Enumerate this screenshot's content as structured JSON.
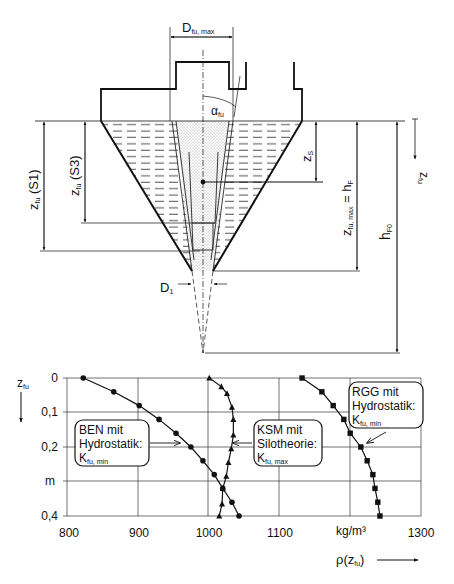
{
  "diagram": {
    "labels": {
      "d_fu_max": "D",
      "d_fu_max_sub": "fu, max",
      "alpha_fu": "α",
      "alpha_fu_sub": "fu",
      "z_s": "z",
      "z_s_sub": "S",
      "z_fu_max_hf": "z",
      "z_fu_max_hf_sub": "fu, max",
      "z_fu_max_hf_eq": " = h",
      "z_fu_max_hf_eq_sub": "F",
      "h_f0": "h",
      "h_f0_sub": "F0",
      "z_fu_axis": "z",
      "z_fu_axis_sub": "fu",
      "z_fu_s1": "z",
      "z_fu_s1_sub": "fu",
      "z_fu_s1_tail": " (S1)",
      "z_fu_s3": "z",
      "z_fu_s3_sub": "fu",
      "z_fu_s3_tail": " (S3)",
      "d1": "D",
      "d1_sub": "1"
    }
  },
  "chart": {
    "y_axis_label": "z",
    "y_axis_label_sub": "fu",
    "y_ticks": [
      "0",
      "0,1",
      "0,2",
      "m",
      "0,4"
    ],
    "x_ticks": [
      "800",
      "900",
      "1000",
      "1100",
      "kg/m³",
      "1300"
    ],
    "x_axis_label": "ρ(z",
    "x_axis_label_sub": "fu",
    "x_axis_label_tail": ")",
    "annotations": {
      "ben": {
        "line1": "BEN mit",
        "line2": "Hydrostatik:",
        "line3": "K",
        "line3_sub": "fu, min"
      },
      "ksm": {
        "line1": "KSM mit",
        "line2": "Silotheorie:",
        "line3": "K",
        "line3_sub": "fu, max"
      },
      "rgg": {
        "line1": "RGG mit",
        "line2": "Hydrostatik:",
        "line3": "K",
        "line3_sub": "fu, min"
      }
    }
  },
  "chart_data": {
    "type": "line",
    "title": "",
    "xlabel": "ρ(z_fu) [kg/m³]",
    "ylabel": "z_fu [m]",
    "xlim": [
      800,
      1300
    ],
    "ylim": [
      0.4,
      0
    ],
    "x_ticks": [
      800,
      900,
      1000,
      1100,
      1200,
      1300
    ],
    "x_tick_labels": [
      "800",
      "900",
      "1000",
      "1100",
      "kg/m³",
      "1300"
    ],
    "y_ticks": [
      0,
      0.1,
      0.2,
      0.3,
      0.4
    ],
    "y_tick_labels": [
      "0",
      "0,1",
      "0,2",
      "m",
      "0,4"
    ],
    "grid": true,
    "y_inverted": true,
    "series": [
      {
        "name": "BEN mit Hydrostatik: K_fu,min",
        "marker": "circle",
        "rho": [
          823,
          866,
          902,
          930,
          954,
          975,
          992,
          1008,
          1020,
          1033,
          1043
        ],
        "z": [
          0,
          0.04,
          0.08,
          0.12,
          0.16,
          0.2,
          0.24,
          0.28,
          0.32,
          0.36,
          0.4
        ]
      },
      {
        "name": "KSM mit Silotheorie: K_fu,max",
        "marker": "triangle",
        "rho": [
          1001,
          1018,
          1026,
          1033,
          1035,
          1035,
          1032,
          1028,
          1025,
          1020,
          1019,
          1015
        ],
        "z": [
          0,
          0.025,
          0.045,
          0.085,
          0.12,
          0.165,
          0.205,
          0.245,
          0.285,
          0.32,
          0.365,
          0.4
        ]
      },
      {
        "name": "RGG mit Hydrostatik: K_fu,min",
        "marker": "square",
        "rho": [
          1132,
          1160,
          1176,
          1191,
          1200,
          1215,
          1224,
          1232,
          1235,
          1239,
          1242
        ],
        "z": [
          0,
          0.04,
          0.08,
          0.12,
          0.16,
          0.2,
          0.24,
          0.28,
          0.32,
          0.36,
          0.4
        ]
      }
    ]
  }
}
